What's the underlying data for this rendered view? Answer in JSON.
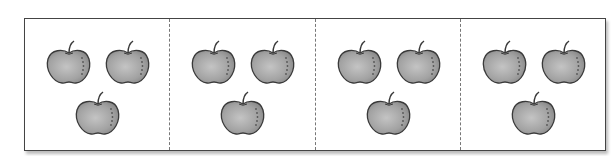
{
  "figure": {
    "panels": [
      {
        "apple_count": 3
      },
      {
        "apple_count": 3
      },
      {
        "apple_count": 3
      },
      {
        "apple_count": 3
      }
    ],
    "colors": {
      "apple_fill": "#a8a8a8",
      "apple_outline": "#3a3a3a",
      "border": "#444444",
      "divider": "#777777"
    }
  }
}
